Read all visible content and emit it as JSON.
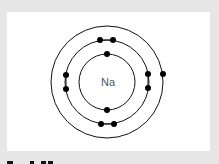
{
  "diagram": {
    "nucleus_label": "Na",
    "shells": [
      {
        "name": "inner",
        "radius": 28,
        "electrons": 2
      },
      {
        "name": "middle",
        "radius": 41,
        "electrons": 8
      },
      {
        "name": "outer",
        "radius": 56,
        "electrons": 1
      }
    ],
    "electron_configuration": "2,8,1",
    "colors": {
      "background": "#e6e6e6",
      "panel": "#ffffff",
      "stroke": "#111111",
      "electron": "#000000",
      "label": "#555555"
    }
  },
  "caption": {
    "text": "",
    "note": "partially cut-off caption text at bottom edge"
  }
}
